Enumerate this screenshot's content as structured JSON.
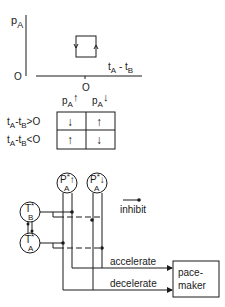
{
  "plot": {
    "y_axis_label": "p",
    "y_axis_sub": "A",
    "y_origin": "O",
    "x_axis_label_t1": "t",
    "x_axis_sub1": "A",
    "x_axis_minus": " - ",
    "x_axis_label_t2": "t",
    "x_axis_sub2": "B",
    "x_origin": "O"
  },
  "table": {
    "col_headers": [
      {
        "label": "p",
        "sub": "A",
        "arrow": "↑"
      },
      {
        "label": "p",
        "sub": "A",
        "arrow": "↓"
      }
    ],
    "rows": [
      {
        "label_t1": "t",
        "sub1": "A",
        "minus": "-",
        "label_t2": "t",
        "sub2": "B",
        "cond": ">O",
        "cells": [
          "↓",
          "↑"
        ]
      },
      {
        "label_t1": "t",
        "sub1": "A",
        "minus": "-",
        "label_t2": "t",
        "sub2": "B",
        "cond": "<O",
        "cells": [
          "↑",
          "↓"
        ]
      }
    ]
  },
  "circuit": {
    "nodes": [
      {
        "id": "PA_up",
        "label": "P",
        "sup": "*",
        "sub": "A",
        "arrow": "↑"
      },
      {
        "id": "PA_down",
        "label": "P",
        "sup": "*",
        "sub": "A",
        "arrow": "↓"
      },
      {
        "id": "TB",
        "label": "T",
        "sup": "*",
        "sub": "B"
      },
      {
        "id": "TA",
        "label": "T",
        "sup": "*",
        "sub": "A"
      }
    ],
    "legend_inhibit": "inhibit",
    "accelerate_label": "accelerate",
    "decelerate_label": "decelerate",
    "pacemaker_line1": "pace-",
    "pacemaker_line2": "maker"
  }
}
